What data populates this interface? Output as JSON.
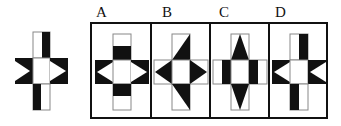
{
  "question": {
    "original_figure": {
      "description": "Cross made of 5 squares; top arm right half black, bottom arm left half black, left and right squares with white right-pointing triangles on black",
      "icon": "cross-figure-icon"
    },
    "options": [
      {
        "label": "A",
        "icon": "cross-option-a-icon"
      },
      {
        "label": "B",
        "icon": "cross-option-b-icon"
      },
      {
        "label": "C",
        "icon": "cross-option-c-icon"
      },
      {
        "label": "D",
        "icon": "cross-option-d-icon"
      }
    ]
  },
  "colors": {
    "ink": "#111111",
    "paper": "#ffffff",
    "outline": "#888888"
  }
}
